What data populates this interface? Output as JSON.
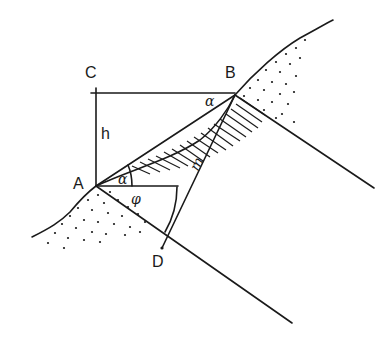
{
  "diagram": {
    "type": "slope-geometry",
    "points": {
      "A": {
        "label": "A",
        "x": 96,
        "y": 186
      },
      "B": {
        "label": "B",
        "x": 235,
        "y": 95
      },
      "C": {
        "label": "C",
        "x": 96,
        "y": 93
      },
      "D": {
        "label": "D",
        "x": 162,
        "y": 248
      }
    },
    "labels": {
      "A": "A",
      "B": "B",
      "C": "C",
      "D": "D",
      "h": "h",
      "m": "m",
      "alpha_at_B": "α",
      "alpha_at_A": "α",
      "phi_at_A": "φ"
    },
    "colors": {
      "ink": "#1a1a1a",
      "background": "#ffffff"
    }
  }
}
